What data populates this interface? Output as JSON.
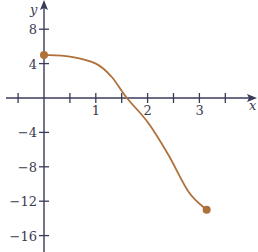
{
  "chart_data": {
    "type": "line",
    "title": "",
    "xlabel": "x",
    "ylabel": "y",
    "xlim": [
      -0.7,
      3.9
    ],
    "ylim": [
      -17.5,
      9.5
    ],
    "x_ticks": [
      1,
      2,
      3
    ],
    "x_tick_labels": [
      "1",
      "2",
      "3"
    ],
    "y_ticks": [
      8,
      4,
      -4,
      -8,
      -12,
      -16
    ],
    "y_tick_labels": [
      "8",
      "4",
      "−4",
      "−8",
      "−12",
      "−16"
    ],
    "grid": false,
    "legend": null,
    "series": [
      {
        "name": "f(x)",
        "color": "#b0703a",
        "x": [
          0,
          0.5,
          1.0,
          1.3,
          1.6,
          2.0,
          2.4,
          2.8,
          3.14
        ],
        "y": [
          5,
          4.8,
          4.0,
          2.5,
          0,
          -2.8,
          -6.6,
          -11.0,
          -13
        ]
      }
    ],
    "endpoints": [
      {
        "x": 0,
        "y": 5,
        "filled": true
      },
      {
        "x": 3.14,
        "y": -13,
        "filled": true
      }
    ],
    "axis_color": "#3a3a5a"
  }
}
